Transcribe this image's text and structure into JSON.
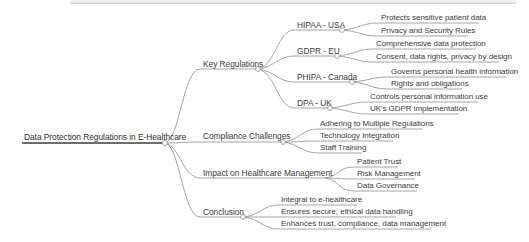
{
  "mindmap": {
    "root": {
      "label": "Data Protection Regulations in E-Healthcare"
    },
    "branches": [
      {
        "label": "Key Regulations",
        "children": [
          {
            "label": "HIPAA - USA",
            "children": [
              {
                "label": "Protects sensitive patient data"
              },
              {
                "label": "Privacy and Security Rules"
              }
            ]
          },
          {
            "label": "GDPR - EU",
            "children": [
              {
                "label": "Comprehensive data protection"
              },
              {
                "label": "Consent, data rights, privacy by design"
              }
            ]
          },
          {
            "label": "PHIPA - Canada",
            "children": [
              {
                "label": "Governs personal health information"
              },
              {
                "label": "Rights and obligations"
              }
            ]
          },
          {
            "label": "DPA - UK",
            "children": [
              {
                "label": "Controls personal information use"
              },
              {
                "label": "UK's GDPR implementation"
              }
            ]
          }
        ]
      },
      {
        "label": "Compliance Challenges",
        "children": [
          {
            "label": "Adhering to Multiple Regulations"
          },
          {
            "label": "Technology Integration"
          },
          {
            "label": "Staff Training"
          }
        ]
      },
      {
        "label": "Impact on Healthcare Management",
        "children": [
          {
            "label": "Patient Trust"
          },
          {
            "label": "Risk Management"
          },
          {
            "label": "Data Governance"
          }
        ]
      },
      {
        "label": "Conclusion",
        "children": [
          {
            "label": "Integral to e-healthcare"
          },
          {
            "label": "Ensures secure, ethical data handling"
          },
          {
            "label": "Enhances trust, compliance, data management"
          }
        ]
      }
    ]
  },
  "colors": {
    "root_line": "#3c3c3c",
    "link": "#9a9a9a",
    "underline": "#a8a8a8",
    "text": "#3b3b3b",
    "node_circle_fill": "#ffffff",
    "node_circle_stroke": "#9a9a9a"
  }
}
